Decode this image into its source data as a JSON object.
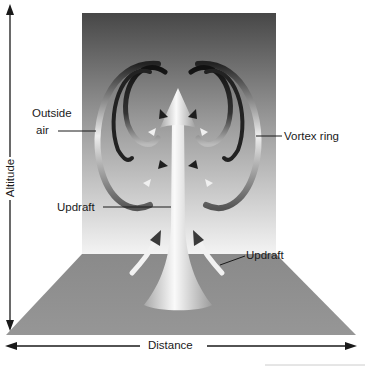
{
  "diagram": {
    "labels": {
      "outside_air_line1": "Outside",
      "outside_air_line2": "air",
      "vortex_ring": "Vortex ring",
      "updraft_column": "Updraft",
      "updraft_ground": "Updraft"
    },
    "axes": {
      "vertical": "Altitude",
      "horizontal": "Distance"
    },
    "colors": {
      "backdrop_top": "#4a4a4a",
      "backdrop_bottom": "#f2f2f2",
      "ground": "#8c8c8c",
      "column_light": "#f5f5f5",
      "column_dark": "#9a9a9a",
      "ink": "#1a1a1a"
    }
  }
}
